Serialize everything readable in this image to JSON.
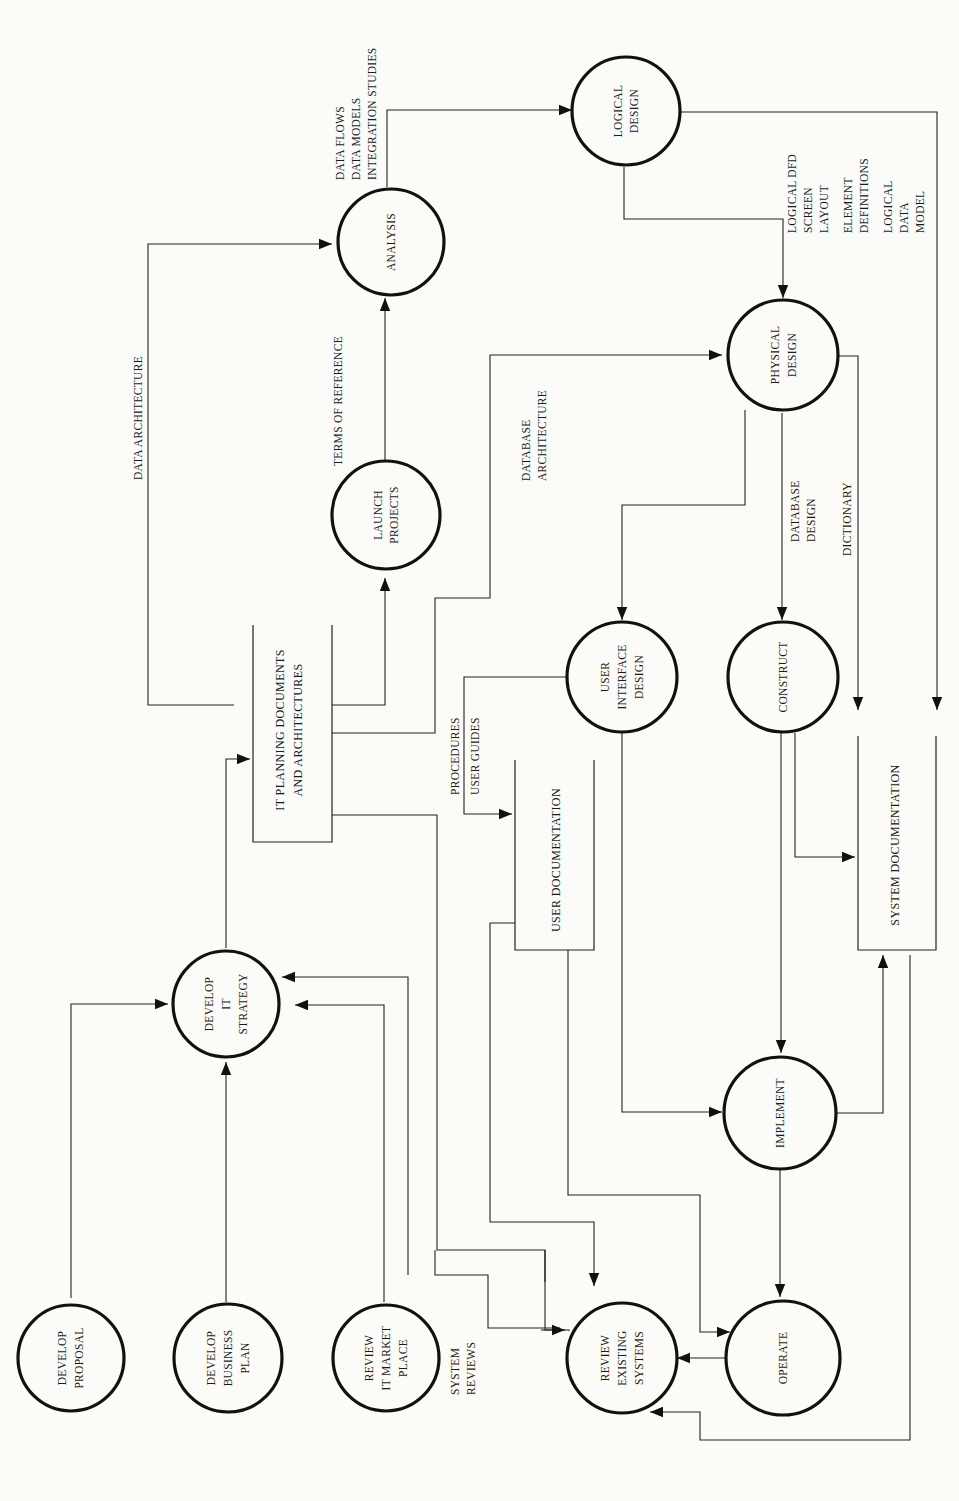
{
  "diagram": {
    "type": "data-flow-diagram",
    "orientation": "rotated-90-ccw",
    "processes": [
      {
        "id": "develop_proposal",
        "lines": [
          "DEVELOP",
          "PROPOSAL"
        ]
      },
      {
        "id": "develop_business_plan",
        "lines": [
          "DEVELOP",
          "BUSINESS",
          "PLAN"
        ]
      },
      {
        "id": "review_it_market_place",
        "lines": [
          "REVIEW",
          "IT MARKET",
          "PLACE"
        ]
      },
      {
        "id": "develop_it_strategy",
        "lines": [
          "DEVELOP",
          "IT",
          "STRATEGY"
        ]
      },
      {
        "id": "launch_projects",
        "lines": [
          "LAUNCH",
          "PROJECTS"
        ]
      },
      {
        "id": "analysis",
        "lines": [
          "ANALYSIS"
        ]
      },
      {
        "id": "logical_design",
        "lines": [
          "LOGICAL",
          "DESIGN"
        ]
      },
      {
        "id": "physical_design",
        "lines": [
          "PHYSICAL",
          "DESIGN"
        ]
      },
      {
        "id": "user_interface_design",
        "lines": [
          "USER",
          "INTERFACE",
          "DESIGN"
        ]
      },
      {
        "id": "construct",
        "lines": [
          "CONSTRUCT"
        ]
      },
      {
        "id": "implement",
        "lines": [
          "IMPLEMENT"
        ]
      },
      {
        "id": "operate",
        "lines": [
          "OPERATE"
        ]
      },
      {
        "id": "review_existing_systems",
        "lines": [
          "REVIEW",
          "EXISTING",
          "SYSTEMS"
        ]
      }
    ],
    "data_stores": [
      {
        "id": "it_planning_docs",
        "lines": [
          "IT PLANNING DOCUMENTS",
          "AND ARCHITECTURES"
        ]
      },
      {
        "id": "user_documentation",
        "lines": [
          "USER DOCUMENTATION"
        ]
      },
      {
        "id": "system_documentation",
        "lines": [
          "SYSTEM DOCUMENTATION"
        ]
      }
    ],
    "flow_labels": {
      "data_architecture": [
        "DATA ARCHITECTURE"
      ],
      "terms_of_reference": [
        "TERMS OF REFERENCE"
      ],
      "analysis_outputs": [
        "DATA FLOWS",
        "DATA MODELS",
        "INTEGRATION STUDIES"
      ],
      "database_architecture": [
        "DATABASE",
        "ARCHITECTURE"
      ],
      "logical_design_outputs": [
        "LOGICAL DFD",
        "SCREEN",
        "LAYOUT",
        "ELEMENT",
        "DEFINITIONS",
        "LOGICAL",
        "DATA",
        "MODEL"
      ],
      "database_design": [
        "DATABASE",
        "DESIGN"
      ],
      "dictionary": [
        "DICTIONARY"
      ],
      "procedures_user_guides": [
        "PROCEDURES",
        "USER GUIDES"
      ],
      "system_reviews": [
        "SYSTEM",
        "REVIEWS"
      ]
    }
  }
}
